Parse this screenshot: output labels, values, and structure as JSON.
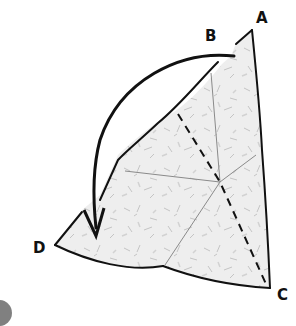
{
  "diagram": {
    "type": "origami-fold-instruction",
    "labels": [
      {
        "id": "A",
        "text": "A",
        "x": 256,
        "y": 11
      },
      {
        "id": "B",
        "text": "B",
        "x": 205,
        "y": 29
      },
      {
        "id": "C",
        "text": "C",
        "x": 277,
        "y": 288
      },
      {
        "id": "D",
        "text": "D",
        "x": 33,
        "y": 241
      }
    ],
    "arrow": {
      "description": "fold point B down to point D",
      "from": "B",
      "to": "D"
    },
    "fold_line": {
      "style": "dashed",
      "description": "valley fold line toward C"
    },
    "colors": {
      "paper_fill": "#ececec",
      "outline": "#111111",
      "crease": "#8a8a8a",
      "texture": "#b5b5b5"
    }
  }
}
